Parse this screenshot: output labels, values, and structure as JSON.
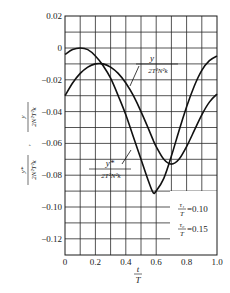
{
  "chart_data": {
    "type": "line",
    "title": "",
    "xlabel": "t/T",
    "xlabel_num": "t",
    "xlabel_den": "T",
    "ylabel": "y*/(2N²T²k) , y/(2N²T²k)",
    "ylabel_parts": {
      "first_num": "y*",
      "first_den": "2N²T²k",
      "separator": ",",
      "second_num": "y",
      "second_den": "2N²T²k"
    },
    "xlim": [
      0,
      1.0
    ],
    "ylim": [
      -0.13,
      0.02
    ],
    "grid": true,
    "x_ticks": [
      "0",
      "0.2",
      "0.4",
      "0.6",
      "0.8",
      "1.0"
    ],
    "y_ticks": [
      "0.02",
      "0",
      "-0.02",
      "-0.04",
      "-0.06",
      "-0.08",
      "-0.10",
      "-0.12"
    ],
    "x": [
      0.0,
      0.05,
      0.1,
      0.15,
      0.2,
      0.25,
      0.3,
      0.35,
      0.4,
      0.45,
      0.5,
      0.55,
      0.58,
      0.6,
      0.65,
      0.7,
      0.75,
      0.8,
      0.85,
      0.9,
      0.95,
      1.0
    ],
    "series": [
      {
        "name": "y*/(2T²N²k)",
        "label_num": "y*",
        "label_den": "2T²N²k",
        "values": [
          -0.004,
          -0.001,
          0.0,
          -0.001,
          -0.005,
          -0.011,
          -0.019,
          -0.03,
          -0.042,
          -0.056,
          -0.07,
          -0.084,
          -0.091,
          -0.09,
          -0.082,
          -0.068,
          -0.052,
          -0.037,
          -0.024,
          -0.014,
          -0.008,
          -0.005
        ]
      },
      {
        "name": "y/(2T²N²k)",
        "label_num": "y",
        "label_den": "2T²N²k",
        "values": [
          -0.03,
          -0.022,
          -0.016,
          -0.012,
          -0.01,
          -0.01,
          -0.012,
          -0.016,
          -0.022,
          -0.03,
          -0.04,
          -0.051,
          -0.058,
          -0.062,
          -0.07,
          -0.073,
          -0.07,
          -0.062,
          -0.052,
          -0.042,
          -0.034,
          -0.029
        ]
      }
    ],
    "annotations": [
      {
        "num": "τ₁",
        "den": "T",
        "value": "=0.10"
      },
      {
        "num": "τ₀",
        "den": "T",
        "value": "=0.15"
      }
    ]
  }
}
